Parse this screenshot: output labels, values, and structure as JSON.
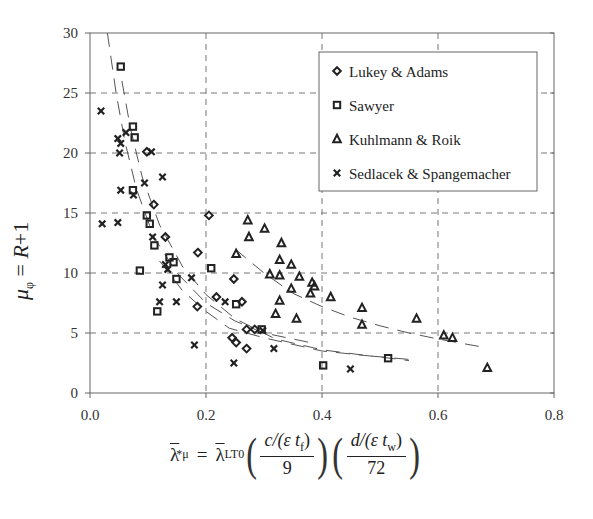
{
  "chart_data": {
    "type": "scatter",
    "title": "",
    "xlabel": "λ̄*_μ = λ̄_LT0 ((c/(ε t_f))/9) ((d/(ε t_w))/72)",
    "ylabel": "μ_φ = R+1",
    "xlim": [
      0.0,
      0.8
    ],
    "ylim": [
      0,
      30
    ],
    "x_ticks": [
      "0.0",
      "0.2",
      "0.4",
      "0.6",
      "0.8"
    ],
    "y_ticks": [
      "0",
      "5",
      "10",
      "15",
      "20",
      "25",
      "30"
    ],
    "grid": true,
    "legend_position": "upper right",
    "series": [
      {
        "name": "Lukey & Adams",
        "marker": "diamond",
        "points": [
          [
            0.098,
            20.1
          ],
          [
            0.11,
            15.7
          ],
          [
            0.205,
            14.8
          ],
          [
            0.13,
            13.0
          ],
          [
            0.186,
            11.7
          ],
          [
            0.248,
            9.5
          ],
          [
            0.218,
            8.0
          ],
          [
            0.262,
            7.6
          ],
          [
            0.185,
            7.2
          ],
          [
            0.27,
            5.3
          ],
          [
            0.284,
            5.3
          ],
          [
            0.245,
            4.6
          ],
          [
            0.252,
            4.2
          ],
          [
            0.27,
            3.7
          ]
        ]
      },
      {
        "name": "Sawyer",
        "marker": "square",
        "points": [
          [
            0.053,
            27.2
          ],
          [
            0.074,
            22.2
          ],
          [
            0.077,
            21.3
          ],
          [
            0.074,
            16.9
          ],
          [
            0.098,
            14.8
          ],
          [
            0.103,
            14.1
          ],
          [
            0.111,
            12.3
          ],
          [
            0.137,
            11.3
          ],
          [
            0.144,
            10.9
          ],
          [
            0.086,
            10.2
          ],
          [
            0.209,
            10.4
          ],
          [
            0.149,
            9.5
          ],
          [
            0.116,
            6.8
          ],
          [
            0.252,
            7.4
          ],
          [
            0.296,
            5.3
          ],
          [
            0.402,
            2.3
          ],
          [
            0.514,
            2.9
          ]
        ]
      },
      {
        "name": "Kuhlmann & Roik",
        "marker": "triangle",
        "points": [
          [
            0.272,
            14.4
          ],
          [
            0.301,
            13.7
          ],
          [
            0.274,
            13.0
          ],
          [
            0.33,
            12.5
          ],
          [
            0.252,
            11.6
          ],
          [
            0.327,
            11.1
          ],
          [
            0.347,
            10.7
          ],
          [
            0.31,
            9.9
          ],
          [
            0.327,
            9.8
          ],
          [
            0.361,
            9.7
          ],
          [
            0.383,
            9.2
          ],
          [
            0.387,
            8.9
          ],
          [
            0.347,
            8.7
          ],
          [
            0.38,
            8.3
          ],
          [
            0.327,
            7.7
          ],
          [
            0.32,
            6.6
          ],
          [
            0.356,
            6.2
          ],
          [
            0.415,
            8.0
          ],
          [
            0.469,
            7.1
          ],
          [
            0.469,
            5.7
          ],
          [
            0.563,
            6.2
          ],
          [
            0.61,
            4.8
          ],
          [
            0.625,
            4.6
          ],
          [
            0.685,
            2.1
          ]
        ]
      },
      {
        "name": "Sedlacek & Spangemacher",
        "marker": "x",
        "points": [
          [
            0.019,
            23.5
          ],
          [
            0.062,
            21.7
          ],
          [
            0.048,
            21.2
          ],
          [
            0.053,
            20.8
          ],
          [
            0.051,
            20.0
          ],
          [
            0.106,
            20.1
          ],
          [
            0.125,
            18.0
          ],
          [
            0.094,
            17.5
          ],
          [
            0.053,
            16.9
          ],
          [
            0.075,
            16.5
          ],
          [
            0.021,
            14.1
          ],
          [
            0.048,
            14.2
          ],
          [
            0.108,
            13.0
          ],
          [
            0.13,
            10.7
          ],
          [
            0.134,
            10.3
          ],
          [
            0.175,
            9.6
          ],
          [
            0.125,
            9.0
          ],
          [
            0.12,
            7.6
          ],
          [
            0.149,
            7.6
          ],
          [
            0.233,
            7.6
          ],
          [
            0.18,
            4.0
          ],
          [
            0.298,
            5.2
          ],
          [
            0.317,
            3.7
          ],
          [
            0.248,
            2.5
          ],
          [
            0.449,
            2.0
          ]
        ]
      }
    ],
    "fit_curves": [
      {
        "name": "fit-1",
        "points": [
          [
            0.03,
            30
          ],
          [
            0.045,
            25
          ],
          [
            0.06,
            21
          ],
          [
            0.08,
            17
          ],
          [
            0.11,
            13
          ],
          [
            0.15,
            10
          ],
          [
            0.2,
            7.5
          ],
          [
            0.25,
            6.0
          ],
          [
            0.3,
            5.0
          ],
          [
            0.38,
            4.2
          ]
        ]
      },
      {
        "name": "fit-2",
        "points": [
          [
            0.055,
            26
          ],
          [
            0.07,
            22
          ],
          [
            0.09,
            18
          ],
          [
            0.12,
            14
          ],
          [
            0.16,
            10.5
          ],
          [
            0.2,
            8.2
          ],
          [
            0.25,
            6.2
          ],
          [
            0.32,
            4.5
          ],
          [
            0.4,
            3.6
          ],
          [
            0.48,
            3.1
          ],
          [
            0.55,
            2.8
          ]
        ]
      },
      {
        "name": "fit-3",
        "points": [
          [
            0.12,
            11
          ],
          [
            0.16,
            8.5
          ],
          [
            0.2,
            6.8
          ],
          [
            0.24,
            5.4
          ],
          [
            0.3,
            4.6
          ],
          [
            0.4,
            3.5
          ],
          [
            0.5,
            3.0
          ],
          [
            0.55,
            2.7
          ]
        ]
      },
      {
        "name": "fit-4",
        "points": [
          [
            0.25,
            12.0
          ],
          [
            0.3,
            10.0
          ],
          [
            0.35,
            8.3
          ],
          [
            0.4,
            7.2
          ],
          [
            0.45,
            6.3
          ],
          [
            0.5,
            5.6
          ],
          [
            0.55,
            5.0
          ],
          [
            0.6,
            4.5
          ],
          [
            0.68,
            3.8
          ]
        ]
      }
    ]
  },
  "legend": {
    "items": [
      {
        "label": "Lukey & Adams",
        "marker": "diamond"
      },
      {
        "label": "Sawyer",
        "marker": "square"
      },
      {
        "label": "Kuhlmann & Roik",
        "marker": "triangle"
      },
      {
        "label": "Sedlacek & Spangemacher",
        "marker": "x"
      }
    ]
  },
  "axis_labels": {
    "y": {
      "mu": "μ",
      "sub": "φ",
      "rest": " = ",
      "R": "R",
      "tail": "+1"
    },
    "x": {
      "lhs": "λ",
      "lhs_sup": "*",
      "lhs_sub": "μ",
      "eq": "=",
      "rhs": "λ",
      "rhs_sub": "LT0",
      "f1_num": "c/(ε t",
      "f1_num_sub": "f",
      "f1_num_close": ")",
      "f1_den": "9",
      "f2_num": "d/(ε t",
      "f2_num_sub": "w",
      "f2_num_close": ")",
      "f2_den": "72",
      "lparen": "(",
      "rparen": ")"
    }
  }
}
